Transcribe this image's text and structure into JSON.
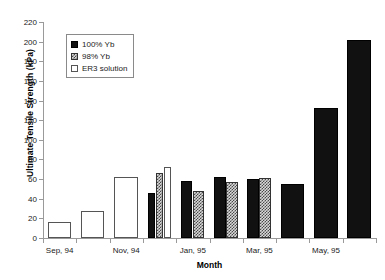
{
  "chart_data": {
    "type": "bar",
    "title": "",
    "xlabel": "Month",
    "ylabel": "Ultimate Tensile Strength (kPa)",
    "ylim": [
      0,
      220
    ],
    "ytick_step": 20,
    "yticks": [
      0,
      20,
      40,
      60,
      80,
      100,
      120,
      140,
      160,
      180,
      200,
      220
    ],
    "grid": false,
    "legend_position": "upper-left-inset",
    "categories": [
      "Sep, 94",
      "Oct, 94",
      "Nov, 94",
      "Dec, 94",
      "Jan, 95",
      "Feb, 95",
      "Mar, 95",
      "Apr, 95",
      "May, 95",
      "Jun, 95"
    ],
    "tick_labels": [
      "Sep, 94",
      "",
      "Nov, 94",
      "",
      "Jan, 95",
      "",
      "Mar, 95",
      "",
      "May, 95",
      ""
    ],
    "series": [
      {
        "name": "100% Yb",
        "fill": "solid",
        "color": "#111111",
        "values": [
          null,
          null,
          null,
          46,
          58,
          62,
          60,
          55,
          132,
          202
        ]
      },
      {
        "name": "98% Yb",
        "fill": "hatch",
        "color": "#d8d8d8",
        "values": [
          null,
          null,
          null,
          66,
          48,
          57,
          61,
          null,
          null,
          null
        ]
      },
      {
        "name": "ER3 solution",
        "fill": "open",
        "color": "#ffffff",
        "values": [
          16,
          28,
          62,
          72,
          null,
          null,
          null,
          null,
          null,
          null
        ]
      }
    ]
  },
  "legend": {
    "items": [
      {
        "label": "100% Yb",
        "fill": "solid"
      },
      {
        "label": "98% Yb",
        "fill": "hatch"
      },
      {
        "label": "ER3 solution",
        "fill": "open"
      }
    ]
  }
}
